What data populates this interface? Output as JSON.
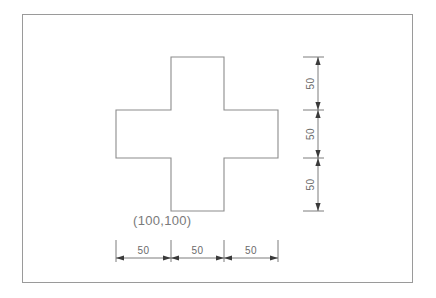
{
  "drawing": {
    "title": "Cross (plus) shape with chained dimensions",
    "background_color": "#ffffff",
    "frame": {
      "border_color": "#9a9a9a",
      "x": 22,
      "y": 14,
      "width": 391,
      "height": 269
    },
    "shape": {
      "name": "cross",
      "outline_color": "#8c8c8c",
      "vertices": [
        [
          171,
          57
        ],
        [
          224,
          57
        ],
        [
          224,
          110
        ],
        [
          278,
          110
        ],
        [
          278,
          158
        ],
        [
          224,
          158
        ],
        [
          224,
          211
        ],
        [
          171,
          211
        ],
        [
          171,
          158
        ],
        [
          116,
          158
        ],
        [
          116,
          110
        ],
        [
          171,
          110
        ]
      ]
    },
    "origin_label": {
      "text": "(100,100)",
      "color": "#7a7a7a",
      "x": 133,
      "y": 225
    },
    "dimension_color": "#6e6e6e",
    "horizontal_dimensions": {
      "orientation": "horizontal",
      "baseline_y": 258,
      "extension_top_y": 240,
      "ticks_x": [
        116,
        171,
        224,
        278
      ],
      "segments": [
        {
          "label": "50",
          "from_x": 116,
          "to_x": 171
        },
        {
          "label": "50",
          "from_x": 171,
          "to_x": 224
        },
        {
          "label": "50",
          "from_x": 224,
          "to_x": 278
        }
      ]
    },
    "vertical_dimensions": {
      "orientation": "vertical",
      "baseline_x": 318,
      "extension_left_x": 303,
      "ticks_y": [
        57,
        110,
        158,
        211
      ],
      "segments": [
        {
          "label": "50",
          "from_y": 57,
          "to_y": 110
        },
        {
          "label": "50",
          "from_y": 110,
          "to_y": 158
        },
        {
          "label": "50",
          "from_y": 158,
          "to_y": 211
        }
      ]
    }
  }
}
